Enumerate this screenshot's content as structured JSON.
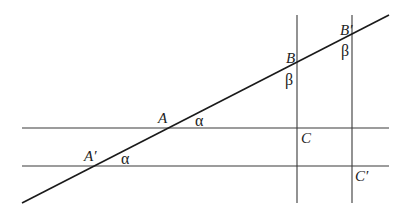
{
  "diagram": {
    "type": "geometry",
    "lines": {
      "transversal": {
        "x1": 22,
        "y1": 203,
        "x2": 389,
        "y2": 15
      },
      "horizontal_1": {
        "x1": 22,
        "y1": 128,
        "x2": 389,
        "y2": 128
      },
      "horizontal_2": {
        "x1": 22,
        "y1": 166,
        "x2": 389,
        "y2": 166
      },
      "vertical_1": {
        "x1": 297,
        "y1": 15,
        "x2": 297,
        "y2": 203
      },
      "vertical_2": {
        "x1": 352,
        "y1": 15,
        "x2": 352,
        "y2": 203
      }
    },
    "labels": {
      "A": "A",
      "A_prime": "A′",
      "B": "B",
      "B_prime": "B′",
      "C": "C",
      "C_prime": "C′",
      "alpha_1": "α",
      "alpha_2": "α",
      "beta_1": "β",
      "beta_2": "β"
    },
    "colors": {
      "stroke": "#2a2a2a",
      "text": "#222222",
      "background": "#ffffff"
    }
  }
}
